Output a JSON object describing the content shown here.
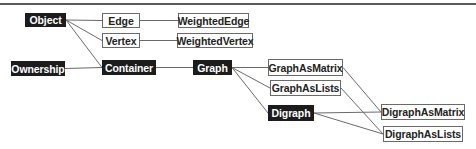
{
  "diagram": {
    "type": "class-hierarchy",
    "nodes": [
      {
        "id": "object",
        "label": "Object",
        "style": "abstract"
      },
      {
        "id": "edge",
        "label": "Edge",
        "style": "concrete"
      },
      {
        "id": "weightededge",
        "label": "WeightedEdge",
        "style": "concrete"
      },
      {
        "id": "vertex",
        "label": "Vertex",
        "style": "concrete"
      },
      {
        "id": "weightedvertex",
        "label": "WeightedVertex",
        "style": "concrete"
      },
      {
        "id": "ownership",
        "label": "Ownership",
        "style": "abstract"
      },
      {
        "id": "container",
        "label": "Container",
        "style": "abstract"
      },
      {
        "id": "graph",
        "label": "Graph",
        "style": "abstract"
      },
      {
        "id": "graphasmatrix",
        "label": "GraphAsMatrix",
        "style": "concrete"
      },
      {
        "id": "graphaslists",
        "label": "GraphAsLists",
        "style": "concrete"
      },
      {
        "id": "digraph",
        "label": "Digraph",
        "style": "abstract"
      },
      {
        "id": "digraphasmatrix",
        "label": "DigraphAsMatrix",
        "style": "concrete"
      },
      {
        "id": "digraphaslists",
        "label": "DigraphAsLists",
        "style": "concrete"
      }
    ],
    "edges": [
      [
        "object",
        "edge"
      ],
      [
        "object",
        "vertex"
      ],
      [
        "object",
        "container"
      ],
      [
        "edge",
        "weightededge"
      ],
      [
        "vertex",
        "weightedvertex"
      ],
      [
        "ownership",
        "container"
      ],
      [
        "container",
        "graph"
      ],
      [
        "graph",
        "graphasmatrix"
      ],
      [
        "graph",
        "graphaslists"
      ],
      [
        "graph",
        "digraph"
      ],
      [
        "graphasmatrix",
        "digraphasmatrix"
      ],
      [
        "graphaslists",
        "digraphaslists"
      ],
      [
        "digraph",
        "digraphasmatrix"
      ],
      [
        "digraph",
        "digraphaslists"
      ]
    ],
    "colors": {
      "abstract_fill": "#1c1c1c",
      "abstract_text": "#ffffff",
      "concrete_fill": "#ffffff",
      "concrete_text": "#222222",
      "connector": "#6a6a6a"
    }
  }
}
